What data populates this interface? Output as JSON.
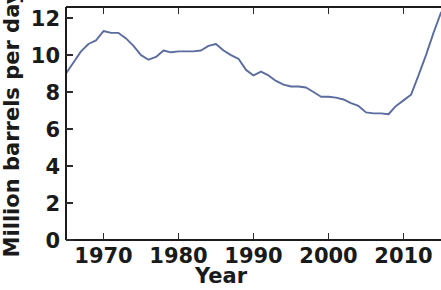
{
  "chart_data": {
    "type": "line",
    "title": "",
    "xlabel": "Year",
    "ylabel": "Million barrels per day",
    "xlim": [
      1965,
      2015
    ],
    "ylim": [
      0,
      12.6
    ],
    "xticks": [
      1970,
      1980,
      1990,
      2000,
      2010
    ],
    "xtick_labels": [
      "1970",
      "1980",
      "1990",
      "2000",
      "2010"
    ],
    "yticks": [
      0,
      2,
      4,
      6,
      8,
      10,
      12
    ],
    "ytick_labels": [
      "0",
      "2",
      "4",
      "6",
      "8",
      "10",
      "12"
    ],
    "grid": false,
    "legend": null,
    "line_color": "#5b6c9e",
    "axis_color": "#1c1c1c",
    "series": [
      {
        "name": "US crude oil production",
        "x": [
          1965,
          1966,
          1967,
          1968,
          1969,
          1970,
          1971,
          1972,
          1973,
          1974,
          1975,
          1976,
          1977,
          1978,
          1979,
          1980,
          1981,
          1982,
          1983,
          1984,
          1985,
          1986,
          1987,
          1988,
          1989,
          1990,
          1991,
          1992,
          1993,
          1994,
          1995,
          1996,
          1997,
          1998,
          1999,
          2000,
          2001,
          2002,
          2003,
          2004,
          2005,
          2006,
          2007,
          2008,
          2009,
          2010,
          2011,
          2012,
          2013,
          2014,
          2015
        ],
        "values": [
          9.0,
          9.6,
          10.2,
          10.6,
          10.8,
          11.3,
          11.2,
          11.2,
          10.9,
          10.5,
          10.0,
          9.75,
          9.9,
          10.25,
          10.15,
          10.2,
          10.2,
          10.2,
          10.25,
          10.5,
          10.6,
          10.25,
          10.0,
          9.8,
          9.2,
          8.9,
          9.1,
          8.9,
          8.6,
          8.4,
          8.3,
          8.3,
          8.25,
          8.0,
          7.75,
          7.75,
          7.7,
          7.6,
          7.4,
          7.25,
          6.9,
          6.85,
          6.85,
          6.8,
          7.25,
          7.55,
          7.85,
          8.9,
          10.0,
          11.2,
          12.3
        ]
      }
    ]
  },
  "axes": {
    "x_axis_label": "Year",
    "y_axis_label": "Million barrels per day"
  }
}
